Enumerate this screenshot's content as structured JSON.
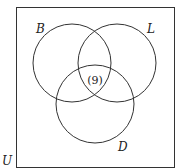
{
  "universe_label": "U",
  "sets": [
    {
      "label": "B",
      "cx": 72,
      "cy": 63,
      "r": 39,
      "lx": 36,
      "ly": 33
    },
    {
      "label": "L",
      "cx": 117,
      "cy": 63,
      "r": 39,
      "lx": 147,
      "ly": 33
    },
    {
      "label": "D",
      "cx": 95,
      "cy": 104,
      "r": 39,
      "lx": 118,
      "ly": 151
    }
  ],
  "regions": [
    {
      "name": "B-L-D intersection",
      "value": "(9)",
      "x": 95,
      "y": 84
    }
  ],
  "stroke_color": "#333333"
}
